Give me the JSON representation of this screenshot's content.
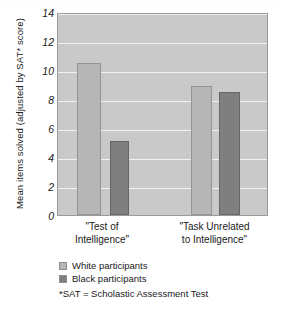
{
  "chart_data": {
    "type": "bar",
    "title": "",
    "xlabel": "",
    "ylabel": "Mean items solved (adjusted by SAT* score)",
    "ylim": [
      0,
      14
    ],
    "yticks": [
      14,
      12,
      10,
      8,
      6,
      4,
      2,
      0
    ],
    "grid": true,
    "legend_position": "below-left",
    "categories": [
      "\"Test of\nIntelligence\"",
      "\"Task Unrelated\nto Intelligence\""
    ],
    "series": [
      {
        "name": "White participants",
        "values": [
          10.5,
          8.9
        ],
        "color": "#b6b6b6"
      },
      {
        "name": "Black participants",
        "values": [
          5.1,
          8.5
        ],
        "color": "#7f7f7f"
      }
    ],
    "footnote": "*SAT = Scholastic Assessment Test"
  },
  "colors": {
    "plot_background": "#c9c9c9",
    "gridline": "#f1f1f1",
    "axis_border": "#9a9a9a",
    "light_series": "#b6b6b6",
    "dark_series": "#7f7f7f",
    "page_background": "#ffffff",
    "text": "#1a1a1a"
  }
}
